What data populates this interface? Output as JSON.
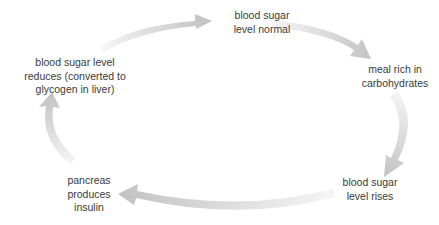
{
  "diagram": {
    "type": "cycle",
    "title": "",
    "stages": [
      {
        "id": "normal",
        "lines": [
          "blood sugar",
          "level normal"
        ]
      },
      {
        "id": "meal",
        "lines": [
          "meal rich in",
          "carbohydrates"
        ]
      },
      {
        "id": "rises",
        "lines": [
          "blood sugar",
          "level rises"
        ]
      },
      {
        "id": "insulin",
        "lines": [
          "pancreas",
          "produces",
          "insulin"
        ]
      },
      {
        "id": "reduces",
        "lines": [
          "blood sugar level",
          "reduces (converted to",
          "glycogen in liver)"
        ]
      }
    ],
    "arrows": [
      {
        "from": "reduces",
        "to": "normal"
      },
      {
        "from": "normal",
        "to": "meal"
      },
      {
        "from": "meal",
        "to": "rises"
      },
      {
        "from": "rises",
        "to": "insulin"
      },
      {
        "from": "insulin",
        "to": "reduces"
      }
    ],
    "colors": {
      "text": "#3a3a3a",
      "arrow_head": "#c4c4c4",
      "arrow_tail": "#f4f4f4"
    }
  }
}
